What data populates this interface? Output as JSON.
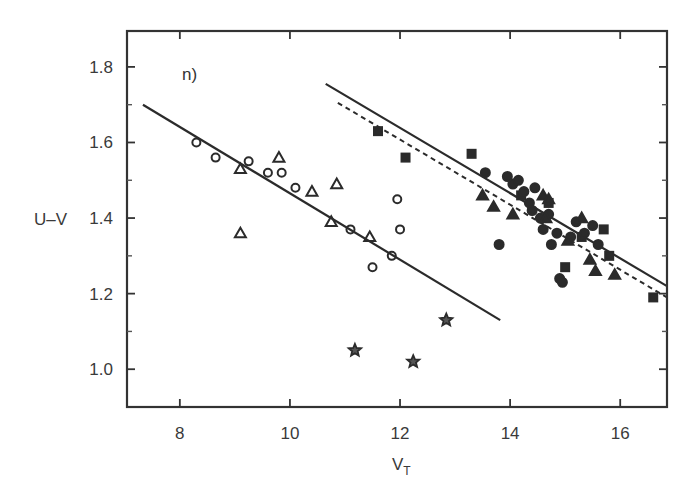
{
  "chart_data": {
    "type": "scatter",
    "title": "",
    "panel_label": "n)",
    "xlabel": "V",
    "xlabel_subscript": "T",
    "ylabel": "U–V",
    "xlim": [
      7.04,
      16.85
    ],
    "ylim": [
      0.9,
      1.895
    ],
    "xticks": [
      8,
      10,
      12,
      14,
      16
    ],
    "xtick_labels": [
      "8",
      "10",
      "12",
      "14",
      "16"
    ],
    "yticks": [
      1.0,
      1.2,
      1.4,
      1.6,
      1.8
    ],
    "ytick_labels": [
      "1.0",
      "1.2",
      "1.4",
      "1.6",
      "1.8"
    ],
    "yminor_ticks": [
      1.1,
      1.3,
      1.5,
      1.7
    ],
    "grid": false,
    "legend": "none",
    "lines": [
      {
        "name": "bright-sequence-fit",
        "style": "solid",
        "x": [
          7.33,
          13.82
        ],
        "y": [
          1.7,
          1.13
        ]
      },
      {
        "name": "faint-sequence-fit",
        "style": "solid",
        "x": [
          10.65,
          16.85
        ],
        "y": [
          1.755,
          1.22
        ]
      },
      {
        "name": "faint-sequence-fit-alt",
        "style": "dashed",
        "x": [
          10.87,
          16.85
        ],
        "y": [
          1.705,
          1.19
        ]
      }
    ],
    "series": [
      {
        "name": "open-circles",
        "marker": "circle",
        "filled": false,
        "x": [
          8.3,
          8.65,
          9.25,
          9.6,
          9.85,
          10.1,
          11.1,
          11.5,
          11.85,
          11.95,
          12.0
        ],
        "y": [
          1.6,
          1.56,
          1.55,
          1.52,
          1.52,
          1.48,
          1.37,
          1.27,
          1.3,
          1.45,
          1.37
        ]
      },
      {
        "name": "open-triangles",
        "marker": "triangle",
        "filled": false,
        "x": [
          9.1,
          9.1,
          9.8,
          10.4,
          10.75,
          10.85,
          11.45
        ],
        "y": [
          1.53,
          1.36,
          1.56,
          1.47,
          1.39,
          1.49,
          1.35
        ]
      },
      {
        "name": "open-stars",
        "marker": "star",
        "filled": false,
        "x": [
          11.18,
          12.24,
          12.84
        ],
        "y": [
          1.05,
          1.02,
          1.13
        ]
      },
      {
        "name": "filled-squares",
        "marker": "square",
        "filled": true,
        "x": [
          11.6,
          12.1,
          13.3,
          14.2,
          14.7,
          15.0,
          15.3,
          15.7,
          15.8,
          16.6
        ],
        "y": [
          1.63,
          1.56,
          1.57,
          1.46,
          1.44,
          1.27,
          1.35,
          1.37,
          1.3,
          1.19
        ]
      },
      {
        "name": "filled-circles",
        "marker": "circle",
        "filled": true,
        "x": [
          13.55,
          13.8,
          13.95,
          14.05,
          14.15,
          14.25,
          14.35,
          14.45,
          14.4,
          14.55,
          14.6,
          14.7,
          14.75,
          14.85,
          14.9,
          14.95,
          15.1,
          15.2,
          15.35,
          15.5,
          15.6
        ],
        "y": [
          1.52,
          1.33,
          1.51,
          1.49,
          1.5,
          1.47,
          1.44,
          1.48,
          1.42,
          1.4,
          1.37,
          1.41,
          1.33,
          1.36,
          1.24,
          1.23,
          1.35,
          1.39,
          1.36,
          1.38,
          1.33
        ]
      },
      {
        "name": "filled-triangles",
        "marker": "triangle",
        "filled": true,
        "x": [
          13.5,
          13.7,
          14.05,
          14.6,
          14.65,
          14.7,
          15.05,
          15.3,
          15.45,
          15.55,
          15.9
        ],
        "y": [
          1.46,
          1.43,
          1.41,
          1.46,
          1.4,
          1.45,
          1.34,
          1.4,
          1.29,
          1.26,
          1.25
        ]
      }
    ]
  },
  "colors": {
    "ink": "#2b2b2b",
    "background": "#ffffff",
    "axis": "#333333"
  }
}
